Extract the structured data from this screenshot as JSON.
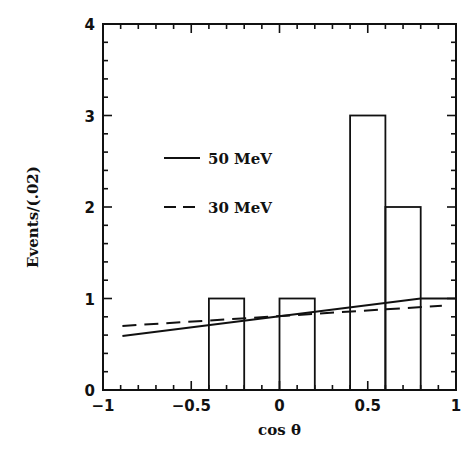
{
  "chart_data": {
    "type": "bar",
    "title": "",
    "xlabel": "cos θ",
    "ylabel": "Events/(.02)",
    "xlim": [
      -1,
      1
    ],
    "ylim": [
      0,
      4
    ],
    "grid": false,
    "x_ticks": [
      {
        "value": -1,
        "label": "−1"
      },
      {
        "value": -0.5,
        "label": "−0.5"
      },
      {
        "value": 0,
        "label": "0"
      },
      {
        "value": 0.5,
        "label": "0.5"
      },
      {
        "value": 1,
        "label": "1"
      }
    ],
    "y_ticks": [
      {
        "value": 0,
        "label": "0"
      },
      {
        "value": 1,
        "label": "1"
      },
      {
        "value": 2,
        "label": "2"
      },
      {
        "value": 3,
        "label": "3"
      },
      {
        "value": 4,
        "label": "4"
      }
    ],
    "x_minor_step": 0.1,
    "y_minor_step": 0.2,
    "histogram": {
      "name": "Data",
      "bins": [
        {
          "x0": -0.4,
          "x1": -0.2,
          "value": 1
        },
        {
          "x0": 0.0,
          "x1": 0.2,
          "value": 1
        },
        {
          "x0": 0.4,
          "x1": 0.6,
          "value": 3
        },
        {
          "x0": 0.6,
          "x1": 0.8,
          "value": 2
        }
      ]
    },
    "series": [
      {
        "name": "50 MeV",
        "style": "solid",
        "x": [
          -0.89,
          0.8,
          1.0
        ],
        "y": [
          0.59,
          1.0,
          1.0
        ]
      },
      {
        "name": "30 MeV",
        "style": "dashed",
        "x": [
          -0.89,
          0.92
        ],
        "y": [
          0.7,
          0.92
        ]
      }
    ],
    "legend": {
      "placement": "upper-left",
      "entries": [
        {
          "label": "50 MeV",
          "style": "solid"
        },
        {
          "label": "30 MeV",
          "style": "dashed"
        }
      ]
    }
  }
}
